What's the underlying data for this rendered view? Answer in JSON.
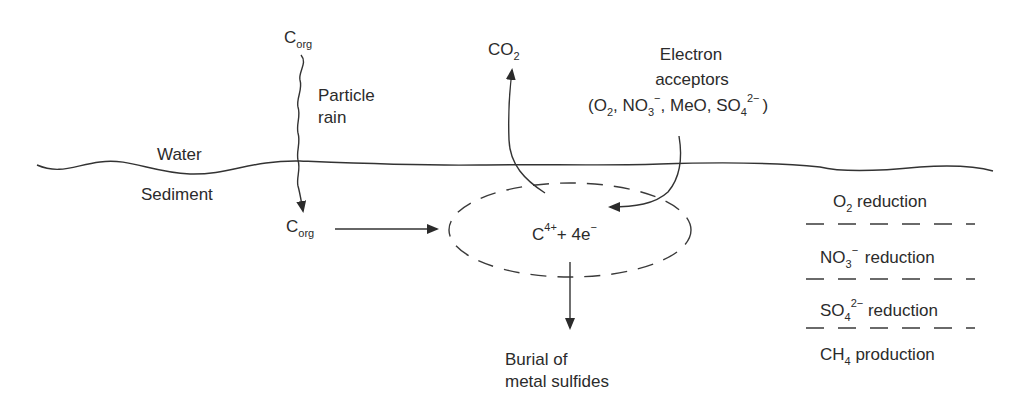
{
  "diagram": {
    "colors": {
      "ink": "#2b2b2b",
      "background": "#ffffff"
    },
    "top": {
      "corg_source": {
        "main": "C",
        "sub": "org"
      },
      "particle_rain": [
        "Particle",
        "rain"
      ],
      "co2": {
        "main": "CO",
        "sub": "2"
      },
      "electron_acceptors": {
        "line1": "Electron",
        "line2": "acceptors",
        "list": {
          "open": "(O",
          "o2_sub": "2",
          "no3": ", NO",
          "no3_sub": "3",
          "no3_sup": "−",
          "meo": ", MeO, SO",
          "so4_sub": "4",
          "so4_sup": "2−",
          "close": ")"
        }
      }
    },
    "interface": {
      "water_label": "Water",
      "sediment_label": "Sediment"
    },
    "sediment": {
      "corg_buried": {
        "main": "C",
        "sub": "org"
      },
      "reaction": {
        "c": "C",
        "c_sup": "4+",
        "plus": "+ 4e",
        "e_sup": "−"
      },
      "burial": [
        "Burial of",
        "metal sulfides"
      ]
    },
    "zones": [
      {
        "main": "O",
        "sub": "2",
        "sup": "",
        "rest": " reduction"
      },
      {
        "main": "NO",
        "sub": "3",
        "sup": "−",
        "rest": " reduction"
      },
      {
        "main": "SO",
        "sub": "4",
        "sup": "2−",
        "rest": " reduction"
      },
      {
        "main": "CH",
        "sub": "4",
        "sup": "",
        "rest": " production"
      }
    ]
  }
}
